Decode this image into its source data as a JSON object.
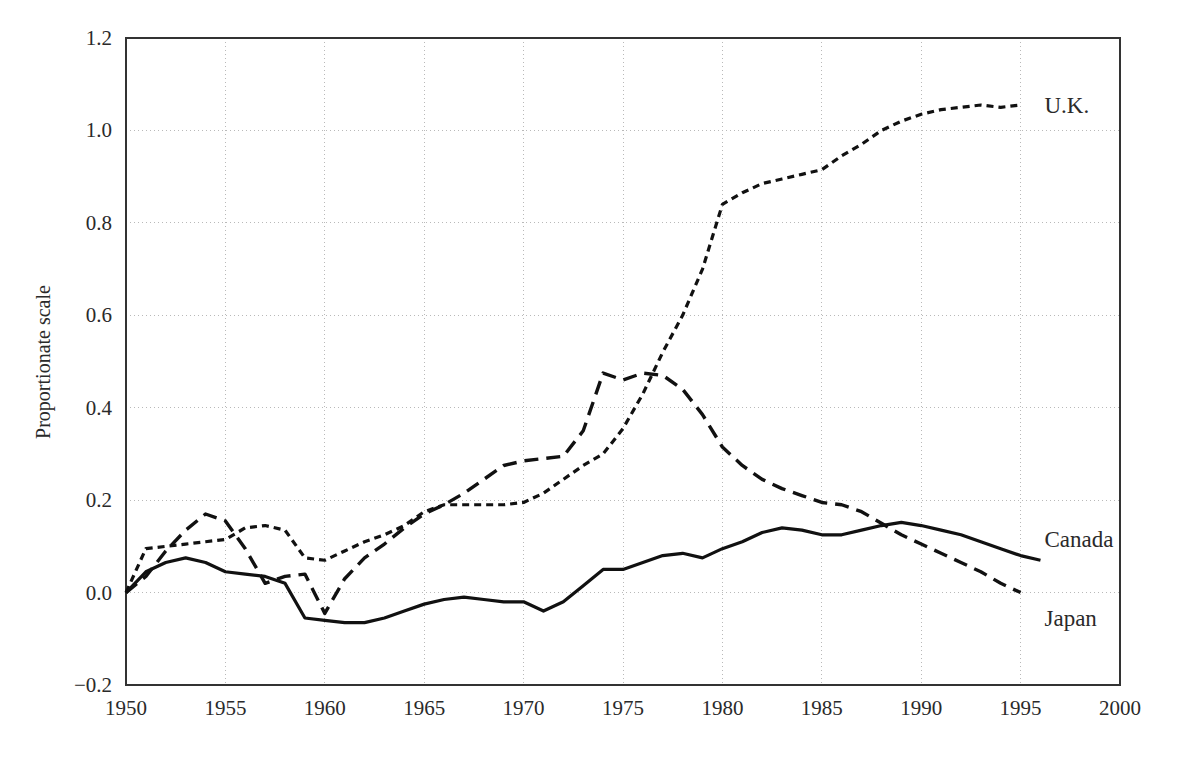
{
  "chart_data": {
    "type": "line",
    "title": "",
    "subtitle": "",
    "xlabel": "",
    "ylabel": "Proportionate scale",
    "xlim": [
      1950,
      2000
    ],
    "ylim": [
      -0.2,
      1.2
    ],
    "grid": true,
    "legend_position": "inline-right-end-of-line",
    "x_ticks": [
      "1950",
      "1955",
      "1960",
      "1965",
      "1970",
      "1975",
      "1980",
      "1985",
      "1990",
      "1995",
      "2000"
    ],
    "y_ticks": [
      "−0.2",
      "0.0",
      "0.2",
      "0.4",
      "0.6",
      "0.8",
      "1.0",
      "1.2"
    ],
    "x_tick_values": [
      1950,
      1955,
      1960,
      1965,
      1970,
      1975,
      1980,
      1985,
      1990,
      1995,
      2000
    ],
    "y_tick_values": [
      -0.2,
      0.0,
      0.2,
      0.4,
      0.6,
      0.8,
      1.0,
      1.2
    ],
    "series": [
      {
        "name": "U.K.",
        "label": "U.K.",
        "style": "dotted",
        "color": "#111111",
        "dash": "7 5",
        "width": 3.2,
        "label_x": 1995.8,
        "label_y": 1.055,
        "x": [
          1950,
          1951,
          1952,
          1953,
          1954,
          1955,
          1956,
          1957,
          1958,
          1959,
          1960,
          1961,
          1962,
          1963,
          1964,
          1965,
          1966,
          1967,
          1968,
          1969,
          1970,
          1971,
          1972,
          1973,
          1974,
          1975,
          1976,
          1977,
          1978,
          1979,
          1980,
          1981,
          1982,
          1983,
          1984,
          1985,
          1986,
          1987,
          1988,
          1989,
          1990,
          1991,
          1992,
          1993,
          1994,
          1995
        ],
        "y": [
          0.0,
          0.095,
          0.1,
          0.105,
          0.11,
          0.115,
          0.14,
          0.145,
          0.135,
          0.075,
          0.07,
          0.09,
          0.11,
          0.125,
          0.145,
          0.175,
          0.19,
          0.19,
          0.19,
          0.19,
          0.195,
          0.215,
          0.245,
          0.275,
          0.3,
          0.355,
          0.43,
          0.52,
          0.6,
          0.7,
          0.84,
          0.865,
          0.885,
          0.895,
          0.905,
          0.915,
          0.945,
          0.97,
          1.0,
          1.02,
          1.035,
          1.045,
          1.05,
          1.055,
          1.05,
          1.055
        ]
      },
      {
        "name": "Japan",
        "label": "Japan",
        "style": "dashed",
        "color": "#111111",
        "dash": "14 8",
        "width": 3.4,
        "label_x": 1995.8,
        "label_y": -0.055,
        "x": [
          1950,
          1951,
          1952,
          1953,
          1954,
          1955,
          1956,
          1957,
          1958,
          1959,
          1960,
          1961,
          1962,
          1963,
          1964,
          1965,
          1966,
          1967,
          1968,
          1969,
          1970,
          1971,
          1972,
          1973,
          1974,
          1975,
          1976,
          1977,
          1978,
          1979,
          1980,
          1981,
          1982,
          1983,
          1984,
          1985,
          1986,
          1987,
          1988,
          1989,
          1990,
          1991,
          1992,
          1993,
          1994,
          1995
        ],
        "y": [
          0.0,
          0.035,
          0.09,
          0.135,
          0.17,
          0.155,
          0.095,
          0.02,
          0.035,
          0.04,
          -0.045,
          0.03,
          0.075,
          0.105,
          0.14,
          0.17,
          0.19,
          0.215,
          0.245,
          0.275,
          0.285,
          0.29,
          0.295,
          0.35,
          0.475,
          0.46,
          0.475,
          0.47,
          0.44,
          0.385,
          0.315,
          0.275,
          0.245,
          0.225,
          0.21,
          0.195,
          0.19,
          0.175,
          0.15,
          0.125,
          0.105,
          0.085,
          0.065,
          0.045,
          0.02,
          0.0
        ]
      },
      {
        "name": "Canada",
        "label": "Canada",
        "style": "solid",
        "color": "#111111",
        "dash": "",
        "width": 3.2,
        "label_x": 1995.8,
        "label_y": 0.115,
        "x": [
          1950,
          1951,
          1952,
          1953,
          1954,
          1955,
          1956,
          1957,
          1958,
          1959,
          1960,
          1961,
          1962,
          1963,
          1964,
          1965,
          1966,
          1967,
          1968,
          1969,
          1970,
          1971,
          1972,
          1973,
          1974,
          1975,
          1976,
          1977,
          1978,
          1979,
          1980,
          1981,
          1982,
          1983,
          1984,
          1985,
          1986,
          1987,
          1988,
          1989,
          1990,
          1991,
          1992,
          1993,
          1994,
          1995,
          1996
        ],
        "y": [
          0.0,
          0.045,
          0.065,
          0.075,
          0.065,
          0.045,
          0.04,
          0.035,
          0.02,
          -0.055,
          -0.06,
          -0.065,
          -0.065,
          -0.055,
          -0.04,
          -0.025,
          -0.015,
          -0.01,
          -0.015,
          -0.02,
          -0.02,
          -0.04,
          -0.02,
          0.015,
          0.05,
          0.05,
          0.065,
          0.08,
          0.085,
          0.075,
          0.095,
          0.11,
          0.13,
          0.14,
          0.135,
          0.125,
          0.125,
          0.135,
          0.145,
          0.152,
          0.145,
          0.135,
          0.125,
          0.11,
          0.095,
          0.08,
          0.07
        ]
      }
    ]
  },
  "plot": {
    "left_px": 126,
    "right_px": 1120,
    "top_px": 38,
    "bottom_px": 685
  }
}
